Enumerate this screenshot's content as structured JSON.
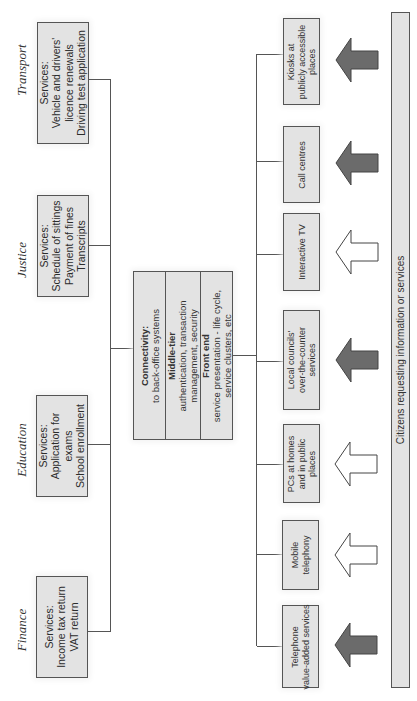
{
  "departments": [
    {
      "name": "Transport",
      "services_title": "Services:",
      "services": [
        "Vehicle and drivers'",
        "licence renewals",
        "Driving test application"
      ]
    },
    {
      "name": "Justice",
      "services_title": "Services:",
      "services": [
        "Schedule of sittings",
        "Payment of fines",
        "Transcripts"
      ]
    },
    {
      "name": "Education",
      "services_title": "Services:",
      "services": [
        "Application for",
        "exams",
        "School enrollment"
      ]
    },
    {
      "name": "Finance",
      "services_title": "Services:",
      "services": [
        "Income tax return",
        "VAT return"
      ]
    }
  ],
  "central_hub": {
    "connectivity": {
      "title": "Connectivity:",
      "text": "to back-office systems"
    },
    "middle_tier": {
      "title": "Middle-tier",
      "text_lines": [
        "authentication, transaction",
        "management, security"
      ]
    },
    "front_end": {
      "title": "Front end",
      "text_lines": [
        "service presentation - life cycle,",
        "service clusters, etc"
      ]
    }
  },
  "channels": [
    {
      "lines": [
        "Kiosks at",
        "publicly accessible",
        "places"
      ],
      "arrow": "filled"
    },
    {
      "lines": [
        "Call centres"
      ],
      "arrow": "filled"
    },
    {
      "lines": [
        "Interactive TV"
      ],
      "arrow": "outline"
    },
    {
      "lines": [
        "Local councils'",
        "over-the-counter",
        "services"
      ],
      "arrow": "filled"
    },
    {
      "lines": [
        "PCs at homes",
        "and in public",
        "places"
      ],
      "arrow": "outline"
    },
    {
      "lines": [
        "Mobile",
        "telephony"
      ],
      "arrow": "outline"
    },
    {
      "lines": [
        "Telephone",
        "value-added services"
      ],
      "arrow": "filled"
    }
  ],
  "citizens_bar": {
    "label": "Citizens requesting information or services"
  },
  "colors": {
    "box_fill": "#e3e3e3",
    "border": "#555555",
    "arrow_filled": "#6b6b6b",
    "arrow_outline": "#ffffff"
  }
}
